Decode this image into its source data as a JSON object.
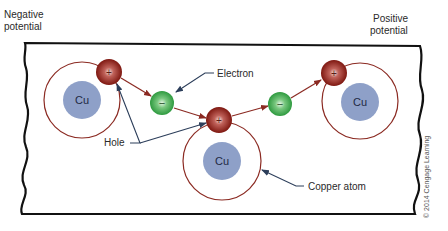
{
  "labels": {
    "negative_potential": [
      "Negative",
      "potential"
    ],
    "positive_potential": [
      "Positive",
      "potential"
    ],
    "electron": "Electron",
    "hole": "Hole",
    "copper_atom": "Copper atom",
    "copyright": "© 2014 Cengage Learning"
  },
  "atoms": [
    {
      "symbol": "Cu"
    },
    {
      "symbol": "Cu"
    },
    {
      "symbol": "Cu"
    }
  ],
  "charges": {
    "hole_symbol": "+",
    "electron_symbol": "−"
  },
  "colors": {
    "frame": "#111111",
    "orbit": "#8b2a22",
    "nucleus": "#8ea0c8",
    "hole": "#8e2018",
    "electron": "#3aa64a",
    "flow_arrow": "#8b2a22",
    "leader": "#2c3e5a"
  }
}
